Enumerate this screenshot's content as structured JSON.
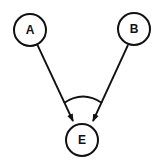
{
  "diagram": {
    "type": "and-graph",
    "nodes": [
      {
        "id": "A",
        "label": "A"
      },
      {
        "id": "B",
        "label": "B"
      },
      {
        "id": "E",
        "label": "E"
      }
    ],
    "edges": [
      {
        "from": "A",
        "to": "E",
        "directed": true
      },
      {
        "from": "B",
        "to": "E",
        "directed": true
      }
    ],
    "conjunction_arc": {
      "connects_edges": [
        "A->E",
        "B->E"
      ],
      "meaning": "AND"
    },
    "colors": {
      "stroke": "#111111",
      "background": "#ffffff"
    }
  }
}
